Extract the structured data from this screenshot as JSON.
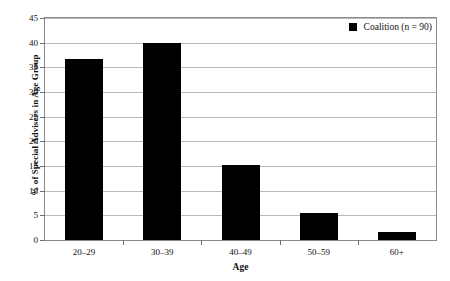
{
  "chart_data": {
    "type": "bar",
    "title": "",
    "xlabel": "Age",
    "ylabel": "% of Special Advisers in Age Group",
    "categories": [
      "20–29",
      "30–39",
      "40–49",
      "50–59",
      "60+"
    ],
    "series": [
      {
        "name": "Coalition (n = 90)",
        "color": "#000000",
        "values": [
          36.7,
          40.0,
          15.3,
          5.5,
          1.7
        ]
      }
    ],
    "ylim": [
      0,
      45
    ],
    "yticks": [
      0,
      5,
      10,
      15,
      20,
      25,
      30,
      35,
      40,
      45
    ],
    "ytick_labels": [
      "0",
      "5",
      "10",
      "15",
      "20",
      "25",
      "30",
      "35",
      "40",
      "45"
    ],
    "grid": true,
    "legend_position": "top-right",
    "legend_entries": [
      {
        "label": "Coalition (n = 90)",
        "marker": "filled-square",
        "color": "#000000"
      }
    ]
  }
}
